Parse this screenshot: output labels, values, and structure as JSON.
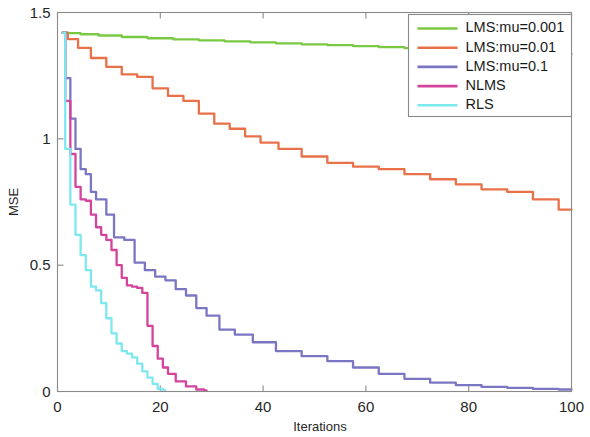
{
  "chart_data": {
    "type": "line",
    "title": "",
    "xlabel": "Iterations",
    "ylabel": "MSE",
    "xlim": [
      0,
      100
    ],
    "ylim": [
      0,
      1.5
    ],
    "xticks": [
      0,
      20,
      40,
      60,
      80,
      100
    ],
    "xtick_labels": [
      "0",
      "20",
      "40",
      "60",
      "80",
      "100"
    ],
    "yticks": [
      0,
      0.5,
      1,
      1.5
    ],
    "ytick_labels": [
      "0",
      "0.5",
      "1",
      "1.5"
    ],
    "grid": false,
    "legend_position": "upper right",
    "series": [
      {
        "name": "LMS:mu=0.001",
        "color": "#7ac943",
        "x": [
          1,
          3,
          6,
          10,
          15,
          20,
          25,
          30,
          35,
          40,
          45,
          50,
          55,
          60,
          65,
          70,
          75,
          80,
          85,
          90,
          95,
          100
        ],
        "values": [
          1.42,
          1.418,
          1.414,
          1.409,
          1.403,
          1.398,
          1.394,
          1.39,
          1.386,
          1.382,
          1.378,
          1.374,
          1.371,
          1.367,
          1.363,
          1.359,
          1.355,
          1.351,
          1.347,
          1.343,
          1.339,
          1.335
        ]
      },
      {
        "name": "LMS:mu=0.01",
        "color": "#e8714a",
        "x": [
          1,
          3,
          5,
          8,
          11,
          14,
          17,
          20,
          23,
          26,
          29,
          32,
          35,
          38,
          41,
          45,
          50,
          55,
          60,
          65,
          70,
          75,
          80,
          85,
          90,
          95,
          100
        ],
        "values": [
          1.42,
          1.395,
          1.36,
          1.32,
          1.285,
          1.255,
          1.245,
          1.2,
          1.17,
          1.15,
          1.1,
          1.06,
          1.04,
          1.01,
          0.985,
          0.96,
          0.93,
          0.905,
          0.89,
          0.88,
          0.86,
          0.84,
          0.82,
          0.8,
          0.79,
          0.76,
          0.72
        ]
      },
      {
        "name": "LMS:mu=0.1",
        "color": "#7b76c4",
        "x": [
          1,
          2,
          3,
          4,
          5,
          6,
          7,
          8,
          9,
          10,
          12,
          14,
          16,
          18,
          20,
          22,
          24,
          26,
          28,
          30,
          33,
          36,
          40,
          45,
          50,
          55,
          60,
          65,
          70,
          75,
          80,
          85,
          90,
          95,
          100
        ],
        "values": [
          1.42,
          1.24,
          1.08,
          0.96,
          0.88,
          0.86,
          0.79,
          0.76,
          0.76,
          0.7,
          0.61,
          0.6,
          0.51,
          0.48,
          0.455,
          0.44,
          0.405,
          0.38,
          0.33,
          0.3,
          0.245,
          0.225,
          0.195,
          0.16,
          0.14,
          0.12,
          0.095,
          0.07,
          0.05,
          0.035,
          0.025,
          0.018,
          0.014,
          0.01,
          0.008
        ]
      },
      {
        "name": "NLMS",
        "color": "#d4449c",
        "x": [
          1,
          2,
          3,
          4,
          5,
          6,
          7,
          8,
          9,
          10,
          11,
          12,
          13,
          14,
          15,
          16,
          17,
          18,
          19,
          20,
          21,
          22,
          24,
          26,
          28,
          29
        ],
        "values": [
          1.42,
          1.15,
          0.94,
          0.81,
          0.76,
          0.755,
          0.7,
          0.65,
          0.62,
          0.6,
          0.56,
          0.5,
          0.45,
          0.42,
          0.415,
          0.41,
          0.39,
          0.26,
          0.18,
          0.13,
          0.095,
          0.07,
          0.04,
          0.02,
          0.008,
          0.004
        ]
      },
      {
        "name": "RLS",
        "color": "#7ee8f0",
        "x": [
          1,
          2,
          3,
          4,
          5,
          6,
          7,
          8,
          9,
          10,
          11,
          12,
          13,
          14,
          15,
          16,
          17,
          18,
          19,
          20,
          21
        ],
        "values": [
          1.42,
          0.96,
          0.74,
          0.62,
          0.54,
          0.48,
          0.415,
          0.4,
          0.35,
          0.29,
          0.23,
          0.19,
          0.16,
          0.15,
          0.135,
          0.11,
          0.08,
          0.055,
          0.03,
          0.01,
          0.004
        ]
      }
    ]
  }
}
